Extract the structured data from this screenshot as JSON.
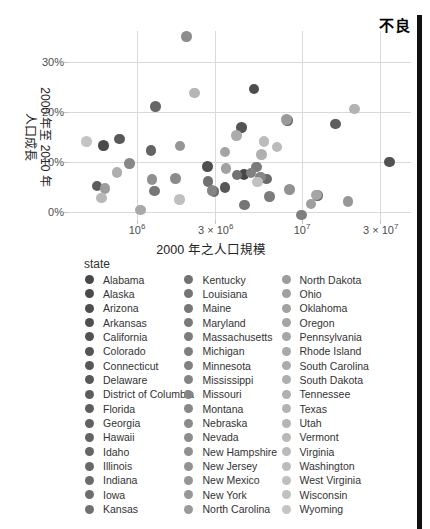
{
  "figure": {
    "quality_label": "不良",
    "bar_color": "#111111",
    "background": "#ffffff",
    "gridline_color": "#d9d9d9"
  },
  "chart_data": {
    "type": "scatter",
    "title": "",
    "xlabel": "2000 年之人口規模",
    "ylabel_line1": "2000 年至 2010 年",
    "ylabel_line2": "人口成長",
    "x_scale": "log",
    "xlim": [
      380000,
      46000000
    ],
    "ylim_pct": [
      -2,
      40
    ],
    "grid": "on",
    "legend_title": "state",
    "legend_position": "bottom",
    "x_ticks": [
      {
        "value": 1000000,
        "label_base": "10",
        "label_exp": "6"
      },
      {
        "value": 3000000,
        "label_base": "3 × 10",
        "label_exp": "6"
      },
      {
        "value": 10000000,
        "label_base": "10",
        "label_exp": "7"
      },
      {
        "value": 30000000,
        "label_base": "3 × 10",
        "label_exp": "7"
      }
    ],
    "y_ticks": [
      {
        "value": 0,
        "label": "0%"
      },
      {
        "value": 10,
        "label": "10%"
      },
      {
        "value": 20,
        "label": "20%"
      },
      {
        "value": 30,
        "label": "30%"
      }
    ],
    "points": [
      {
        "state": "Alabama",
        "pop2000_millions": 4.447,
        "growth_pct": 7.5,
        "color": "#484848"
      },
      {
        "state": "Alaska",
        "pop2000_millions": 0.627,
        "growth_pct": 13.3,
        "color": "#4a4a4a"
      },
      {
        "state": "Arizona",
        "pop2000_millions": 5.131,
        "growth_pct": 24.6,
        "color": "#4d4d4d"
      },
      {
        "state": "Arkansas",
        "pop2000_millions": 2.673,
        "growth_pct": 9.1,
        "color": "#4f4f4f"
      },
      {
        "state": "California",
        "pop2000_millions": 33.872,
        "growth_pct": 10.0,
        "color": "#525252"
      },
      {
        "state": "Colorado",
        "pop2000_millions": 4.301,
        "growth_pct": 16.9,
        "color": "#545454"
      },
      {
        "state": "Connecticut",
        "pop2000_millions": 3.406,
        "growth_pct": 4.9,
        "color": "#575757"
      },
      {
        "state": "Delaware",
        "pop2000_millions": 0.784,
        "growth_pct": 14.6,
        "color": "#595959"
      },
      {
        "state": "District of Columbia",
        "pop2000_millions": 0.572,
        "growth_pct": 5.2,
        "color": "#5c5c5c"
      },
      {
        "state": "Florida",
        "pop2000_millions": 15.982,
        "growth_pct": 17.6,
        "color": "#5e5e5e"
      },
      {
        "state": "Georgia",
        "pop2000_millions": 8.186,
        "growth_pct": 18.3,
        "color": "#616161"
      },
      {
        "state": "Hawaii",
        "pop2000_millions": 1.212,
        "growth_pct": 12.3,
        "color": "#636363"
      },
      {
        "state": "Idaho",
        "pop2000_millions": 1.294,
        "growth_pct": 21.1,
        "color": "#666666"
      },
      {
        "state": "Illinois",
        "pop2000_millions": 12.419,
        "growth_pct": 3.3,
        "color": "#686868"
      },
      {
        "state": "Indiana",
        "pop2000_millions": 6.08,
        "growth_pct": 6.6,
        "color": "#6b6b6b"
      },
      {
        "state": "Iowa",
        "pop2000_millions": 2.926,
        "growth_pct": 4.1,
        "color": "#6d6d6d"
      },
      {
        "state": "Kansas",
        "pop2000_millions": 2.688,
        "growth_pct": 6.1,
        "color": "#707070"
      },
      {
        "state": "Kentucky",
        "pop2000_millions": 4.042,
        "growth_pct": 7.4,
        "color": "#727272"
      },
      {
        "state": "Louisiana",
        "pop2000_millions": 4.469,
        "growth_pct": 1.4,
        "color": "#757575"
      },
      {
        "state": "Maine",
        "pop2000_millions": 1.275,
        "growth_pct": 4.2,
        "color": "#777777"
      },
      {
        "state": "Maryland",
        "pop2000_millions": 5.296,
        "growth_pct": 9.0,
        "color": "#7a7a7a"
      },
      {
        "state": "Massachusetts",
        "pop2000_millions": 6.349,
        "growth_pct": 3.1,
        "color": "#7c7c7c"
      },
      {
        "state": "Michigan",
        "pop2000_millions": 9.938,
        "growth_pct": -0.6,
        "color": "#7f7f7f"
      },
      {
        "state": "Minnesota",
        "pop2000_millions": 4.919,
        "growth_pct": 7.8,
        "color": "#818181"
      },
      {
        "state": "Mississippi",
        "pop2000_millions": 2.845,
        "growth_pct": 4.3,
        "color": "#848484"
      },
      {
        "state": "Missouri",
        "pop2000_millions": 5.595,
        "growth_pct": 7.0,
        "color": "#868686"
      },
      {
        "state": "Montana",
        "pop2000_millions": 0.902,
        "growth_pct": 9.7,
        "color": "#888888"
      },
      {
        "state": "Nebraska",
        "pop2000_millions": 1.711,
        "growth_pct": 6.7,
        "color": "#8b8b8b"
      },
      {
        "state": "Nevada",
        "pop2000_millions": 1.998,
        "growth_pct": 35.1,
        "color": "#8d8d8d"
      },
      {
        "state": "New Hampshire",
        "pop2000_millions": 1.236,
        "growth_pct": 6.5,
        "color": "#909090"
      },
      {
        "state": "New Jersey",
        "pop2000_millions": 8.414,
        "growth_pct": 4.5,
        "color": "#929292"
      },
      {
        "state": "New Mexico",
        "pop2000_millions": 1.819,
        "growth_pct": 13.2,
        "color": "#959595"
      },
      {
        "state": "New York",
        "pop2000_millions": 18.976,
        "growth_pct": 2.1,
        "color": "#979797"
      },
      {
        "state": "North Carolina",
        "pop2000_millions": 8.049,
        "growth_pct": 18.5,
        "color": "#9a9a9a"
      },
      {
        "state": "North Dakota",
        "pop2000_millions": 0.642,
        "growth_pct": 4.7,
        "color": "#9c9c9c"
      },
      {
        "state": "Ohio",
        "pop2000_millions": 11.353,
        "growth_pct": 1.6,
        "color": "#9f9f9f"
      },
      {
        "state": "Oklahoma",
        "pop2000_millions": 3.451,
        "growth_pct": 8.7,
        "color": "#a1a1a1"
      },
      {
        "state": "Oregon",
        "pop2000_millions": 3.421,
        "growth_pct": 12.0,
        "color": "#a4a4a4"
      },
      {
        "state": "Pennsylvania",
        "pop2000_millions": 12.281,
        "growth_pct": 3.4,
        "color": "#a6a6a6"
      },
      {
        "state": "Rhode Island",
        "pop2000_millions": 1.048,
        "growth_pct": 0.4,
        "color": "#a9a9a9"
      },
      {
        "state": "South Carolina",
        "pop2000_millions": 4.012,
        "growth_pct": 15.3,
        "color": "#ababab"
      },
      {
        "state": "South Dakota",
        "pop2000_millions": 0.755,
        "growth_pct": 7.9,
        "color": "#aeaeae"
      },
      {
        "state": "Tennessee",
        "pop2000_millions": 5.689,
        "growth_pct": 11.5,
        "color": "#b0b0b0"
      },
      {
        "state": "Texas",
        "pop2000_millions": 20.852,
        "growth_pct": 20.6,
        "color": "#b3b3b3"
      },
      {
        "state": "Utah",
        "pop2000_millions": 2.233,
        "growth_pct": 23.8,
        "color": "#b5b5b5"
      },
      {
        "state": "Vermont",
        "pop2000_millions": 0.609,
        "growth_pct": 2.8,
        "color": "#b8b8b8"
      },
      {
        "state": "Virginia",
        "pop2000_millions": 7.079,
        "growth_pct": 13.0,
        "color": "#bababa"
      },
      {
        "state": "Washington",
        "pop2000_millions": 5.894,
        "growth_pct": 14.1,
        "color": "#bcbcbc"
      },
      {
        "state": "West Virginia",
        "pop2000_millions": 1.808,
        "growth_pct": 2.5,
        "color": "#bfbfbf"
      },
      {
        "state": "Wisconsin",
        "pop2000_millions": 5.364,
        "growth_pct": 6.0,
        "color": "#c1c1c1"
      },
      {
        "state": "Wyoming",
        "pop2000_millions": 0.494,
        "growth_pct": 14.1,
        "color": "#c4c4c4"
      }
    ]
  }
}
